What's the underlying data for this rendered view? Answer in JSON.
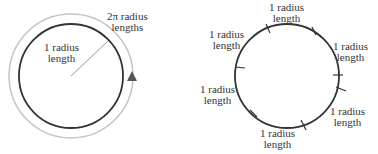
{
  "left_diagram": {
    "radius_label_line1": "1 radius",
    "radius_label_line2": "length",
    "circumference_label_line1": "2π radius",
    "circumference_label_line2": "lengths",
    "arrow_icon": "triangle-up"
  },
  "right_diagram": {
    "segments": [
      {
        "line1": "1 radius",
        "line2": "length"
      },
      {
        "line1": "1 radius",
        "line2": "length"
      },
      {
        "line1": "1 radius",
        "line2": "length"
      },
      {
        "line1": "1 radius",
        "line2": "length"
      },
      {
        "line1": "1 radius",
        "line2": "length"
      },
      {
        "line1": "1 radius",
        "line2": "length"
      }
    ]
  },
  "colors": {
    "circle_dark": "#333333",
    "circle_light": "#bbbbbb",
    "text": "#333333"
  }
}
